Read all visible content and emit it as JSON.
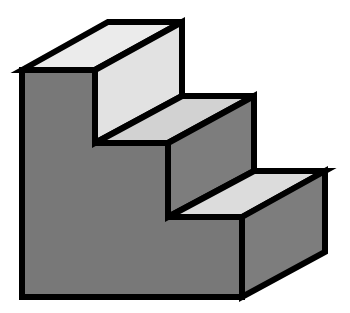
{
  "diagram": {
    "colors": {
      "background": "#ffffff",
      "outline": "#000000",
      "front_face": "#787878",
      "top_face_1": "#ebebeb",
      "riser_face_1": "#e2e2e2",
      "top_face_2": "#d2d2d2",
      "side_face_2": "#7d7d7d",
      "top_face_3": "#dcdcdc",
      "side_face_3": "#7d7d7d"
    },
    "faces": [
      {
        "id": "front-face",
        "points": "22,70 95,70 95,143 168,143 168,217 242,217 242,297 22,297"
      },
      {
        "id": "top-face-step-1",
        "points": "22,70 108,22 182,22 95,70"
      },
      {
        "id": "riser-face-step-1",
        "points": "95,70 182,22 182,96 95,143"
      },
      {
        "id": "top-face-step-2",
        "points": "95,143 182,96 254,96 168,143"
      },
      {
        "id": "side-face-step-2",
        "points": "168,143 254,96 254,171 168,217"
      },
      {
        "id": "top-face-step-3",
        "points": "168,217 254,171 325,171 242,217"
      },
      {
        "id": "side-face-step-3",
        "points": "242,217 325,171 325,252 242,297"
      }
    ]
  }
}
